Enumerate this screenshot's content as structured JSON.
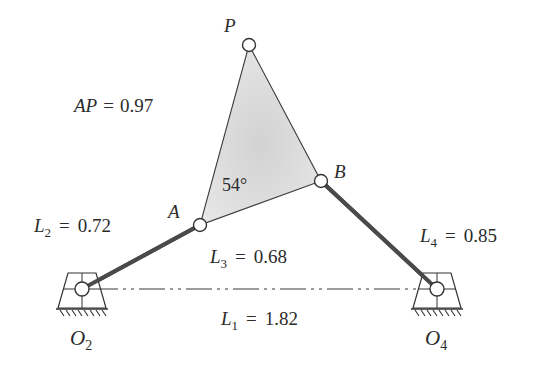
{
  "diagram": {
    "colors": {
      "link": "#4a4a4a",
      "outline": "#3a3a3a",
      "coupler_fill": "#d6d6d6",
      "pin_fill": "#ffffff",
      "text": "#2b2b2b"
    },
    "points": {
      "O2": {
        "label": "O",
        "sub": "2",
        "x": 82,
        "y": 289
      },
      "O4": {
        "label": "O",
        "sub": "4",
        "x": 437,
        "y": 289
      },
      "A": {
        "label": "A",
        "x": 200,
        "y": 225
      },
      "B": {
        "label": "B",
        "x": 321,
        "y": 181
      },
      "P": {
        "label": "P",
        "x": 249,
        "y": 45
      }
    },
    "dimensions": {
      "AP": {
        "name": "AP",
        "eq": "=",
        "value": "0.97"
      },
      "L1": {
        "name": "L",
        "sub": "1",
        "eq": "=",
        "value": "1.82"
      },
      "L2": {
        "name": "L",
        "sub": "2",
        "eq": "=",
        "value": "0.72"
      },
      "L3": {
        "name": "L",
        "sub": "3",
        "eq": "=",
        "value": "0.68"
      },
      "L4": {
        "name": "L",
        "sub": "4",
        "eq": "=",
        "value": "0.85"
      }
    },
    "angle": {
      "value": "54°",
      "vertex": "A"
    }
  }
}
